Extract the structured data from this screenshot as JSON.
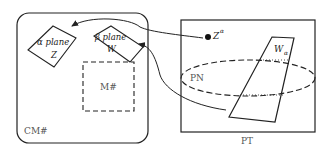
{
  "diagram": {
    "left_region": {
      "label": "CM#",
      "alpha_plane": {
        "line1": "α plane",
        "line2": "Z"
      },
      "beta_plane": {
        "line1": "β plane",
        "line2": "W"
      },
      "inner_box": {
        "label": "M#"
      }
    },
    "right_region": {
      "label": "PT",
      "point": {
        "label": "Z",
        "superscript": "α"
      },
      "ellipse": {
        "label": "PN"
      },
      "parallelogram": {
        "label": "W",
        "subscript": "α"
      }
    },
    "arrows": [
      {
        "from": "Z^α",
        "to": "α plane Z"
      },
      {
        "from": "W_α",
        "to": "β plane W"
      }
    ],
    "colors": {
      "stroke": "#222222",
      "label_gray": "#555555",
      "background": "#ffffff"
    }
  }
}
